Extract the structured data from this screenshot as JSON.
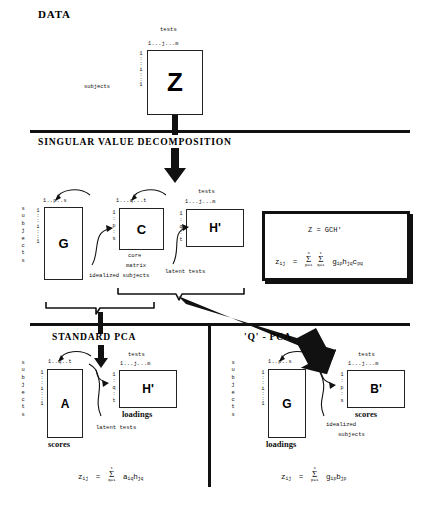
{
  "diagram": {
    "title": "DATA",
    "sections": [
      {
        "id": "svd",
        "label": "SINGULAR VALUE DECOMPOSITION"
      },
      {
        "id": "standard-pca",
        "label": "STANDARD PCA"
      },
      {
        "id": "q-pca",
        "label": "'Q' - PCA"
      }
    ]
  },
  "data_block": {
    "title": "DATA",
    "col_header": "tests",
    "col_index": "1...j...m",
    "row_label": "subjects",
    "row_index": [
      "1",
      ":",
      ":",
      "i",
      ":",
      ":",
      "1"
    ],
    "matrix": "Z"
  },
  "svd_block": {
    "heading": "SINGULAR VALUE DECOMPOSITION",
    "row_label_g": "subjects",
    "g": {
      "name": "G",
      "col_index": "1..p..s",
      "row_index": [
        "1",
        ":",
        ":",
        "i",
        ":",
        ":",
        "1"
      ],
      "caption": "idealized subjects"
    },
    "c": {
      "name": "C",
      "col_index": "1...q...t",
      "row_index": [
        "1",
        ":",
        "p",
        ":",
        "s"
      ],
      "caption_line1": "core",
      "caption_line2": "matrix"
    },
    "h": {
      "name": "H'",
      "col_header": "tests",
      "col_index": "1...j...m",
      "row_index": [
        "1",
        ":",
        "q",
        ":",
        "t"
      ],
      "caption": "latent tests"
    },
    "equation": {
      "line1": "Z  =  GCH'",
      "line2_lhs": "z",
      "line2_lhs_sub": "ij",
      "line2_eq": "=",
      "sum1_upper": "s",
      "sum1_lower": "p=1",
      "sum2_upper": "t",
      "sum2_lower": "q=1",
      "terms": [
        {
          "base": "g",
          "sub": "ip"
        },
        {
          "base": "h",
          "sub": "jq"
        },
        {
          "base": "c",
          "sub": "pq"
        }
      ]
    }
  },
  "standard_pca": {
    "heading": "STANDARD PCA",
    "row_label": "subjects",
    "a": {
      "name": "A",
      "col_index": "1..q..t",
      "row_index": [
        "1",
        ":",
        ":",
        "i",
        ":",
        ":",
        "1"
      ],
      "caption": "scores"
    },
    "h": {
      "name": "H'",
      "col_header": "tests",
      "col_index": "1...j...m",
      "row_index": [
        "1",
        ":",
        "q",
        ":",
        "t"
      ],
      "caption": "loadings",
      "annotation": "latent tests"
    },
    "equation": {
      "lhs": "z",
      "lhs_sub": "ij",
      "eq": "=",
      "sum_upper": "t",
      "sum_lower": "q=1",
      "terms": [
        {
          "base": "a",
          "sub": "iq"
        },
        {
          "base": "h",
          "sub": "jq"
        }
      ]
    }
  },
  "q_pca": {
    "heading": "'Q' - PCA",
    "row_label": "subjects",
    "g": {
      "name": "G",
      "col_index": "1..p..s",
      "row_index": [
        "1",
        ":",
        ":",
        "i",
        ":",
        ":",
        "1"
      ],
      "caption": "loadings"
    },
    "b": {
      "name": "B'",
      "col_header": "tests",
      "col_index": "1...j...m",
      "row_index": [
        "1",
        ":",
        "p",
        ":",
        "s"
      ],
      "caption": "scores",
      "annotation_line1": "idealized",
      "annotation_line2": "subjects"
    },
    "equation": {
      "lhs": "z",
      "lhs_sub": "ij",
      "eq": "=",
      "sum_upper": "s",
      "sum_lower": "p=1",
      "terms": [
        {
          "base": "g",
          "sub": "ip"
        },
        {
          "base": "b",
          "sub": "jp"
        }
      ]
    }
  },
  "colors": {
    "ink": "#111111",
    "paper": "#ffffff"
  }
}
